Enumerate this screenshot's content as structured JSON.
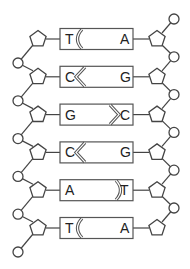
{
  "diagram": {
    "colors": {
      "line": "#444444",
      "box_border": "#555555",
      "text": "#222222",
      "background": "#ffffff"
    },
    "base_pairs": [
      {
        "left": "T",
        "right": "A",
        "bond": "curve-left"
      },
      {
        "left": "C",
        "right": "G",
        "bond": "chevron-left"
      },
      {
        "left": "G",
        "right": "C",
        "bond": "chevron-right"
      },
      {
        "left": "C",
        "right": "G",
        "bond": "chevron-left"
      },
      {
        "left": "A",
        "right": "T",
        "bond": "curve-right"
      },
      {
        "left": "T",
        "right": "A",
        "bond": "curve-left"
      }
    ],
    "left_strand": {
      "sugar_icon": "pentagon",
      "phosphate_icon": "circle"
    },
    "right_strand": {
      "sugar_icon": "pentagon",
      "phosphate_icon": "circle"
    }
  }
}
